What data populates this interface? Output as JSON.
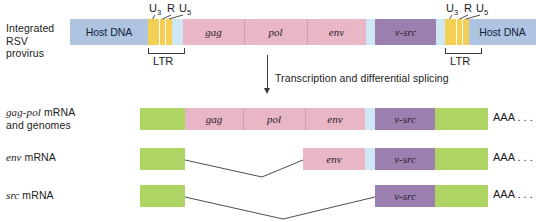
{
  "figure": {
    "background": "#ffffff"
  },
  "colors": {
    "host_dna": "#aec4e0",
    "ltr": "#f5cf55",
    "light_blue": "#cfe7f5",
    "pink": "#e8b6c4",
    "purple": "#9b7fae",
    "green": "#aed464",
    "line": "#3a3a3a"
  },
  "row_labels": {
    "provirus_line1": "Integrated",
    "provirus_line2": "RSV",
    "provirus_line3": "provirus",
    "gagpol_italic": "gag-pol",
    "gagpol_rest": " mRNA",
    "gagpol_line2": "and genomes",
    "env_italic": "env",
    "env_rest": " mRNA",
    "src_italic": "src",
    "src_rest": " mRNA"
  },
  "ltr_annotations": {
    "u3": "U",
    "u3_sub": "3",
    "r": "R",
    "u5": "U",
    "u5_sub": "5",
    "brace_label": "LTR"
  },
  "process_arrow": {
    "label": "Transcription and differential splicing"
  },
  "poly_a": {
    "label": "AAA . . ."
  },
  "provirus_segments": [
    {
      "name": "host-dna-left",
      "label": "Host DNA",
      "color": "host_dna",
      "x": 70,
      "w": 78
    },
    {
      "name": "ltr-left-u3",
      "label": "",
      "color": "ltr",
      "x": 148,
      "w": 11
    },
    {
      "name": "ltr-left-r",
      "label": "",
      "color": "ltr",
      "x": 160,
      "w": 5
    },
    {
      "name": "ltr-left-u5",
      "label": "",
      "color": "ltr",
      "x": 166,
      "w": 6
    },
    {
      "name": "leader-left",
      "label": "",
      "color": "light_blue",
      "x": 172,
      "w": 11
    },
    {
      "name": "gag",
      "label": "gag",
      "color": "pink",
      "x": 183,
      "w": 61
    },
    {
      "name": "pol",
      "label": "pol",
      "color": "pink",
      "x": 244,
      "w": 63
    },
    {
      "name": "env",
      "label": "env",
      "color": "pink",
      "x": 307,
      "w": 59
    },
    {
      "name": "spacer-right",
      "label": "",
      "color": "light_blue",
      "x": 366,
      "w": 9
    },
    {
      "name": "v-src",
      "label": "v-src",
      "color": "purple",
      "x": 375,
      "w": 61
    },
    {
      "name": "spacer-right-2",
      "label": "",
      "color": "light_blue",
      "x": 436,
      "w": 9
    },
    {
      "name": "ltr-right-u3",
      "label": "",
      "color": "ltr",
      "x": 445,
      "w": 11
    },
    {
      "name": "ltr-right-r",
      "label": "",
      "color": "ltr",
      "x": 457,
      "w": 5
    },
    {
      "name": "ltr-right-u5",
      "label": "",
      "color": "ltr",
      "x": 463,
      "w": 6
    },
    {
      "name": "host-dna-right",
      "label": "Host DNA",
      "color": "host_dna",
      "x": 469,
      "w": 67
    }
  ],
  "gagpol_segments": [
    {
      "name": "cap-5prime",
      "label": "",
      "color": "green",
      "x": 140,
      "w": 45
    },
    {
      "name": "gag",
      "label": "gag",
      "color": "pink",
      "x": 185,
      "w": 58
    },
    {
      "name": "pol",
      "label": "pol",
      "color": "pink",
      "x": 243,
      "w": 62
    },
    {
      "name": "env",
      "label": "env",
      "color": "pink",
      "x": 305,
      "w": 60
    },
    {
      "name": "spacer",
      "label": "",
      "color": "light_blue",
      "x": 365,
      "w": 10
    },
    {
      "name": "v-src",
      "label": "v-src",
      "color": "purple",
      "x": 375,
      "w": 60
    },
    {
      "name": "polya-green",
      "label": "",
      "color": "green",
      "x": 435,
      "w": 53
    },
    {
      "name": "poly-a-text",
      "label": "AAA . . .",
      "color": "none",
      "x": 493,
      "w": 43
    }
  ],
  "env_segments": [
    {
      "name": "cap-5prime",
      "label": "",
      "color": "green",
      "x": 140,
      "w": 45
    },
    {
      "name": "env",
      "label": "env",
      "color": "pink",
      "x": 303,
      "w": 62
    },
    {
      "name": "spacer",
      "label": "",
      "color": "light_blue",
      "x": 365,
      "w": 10
    },
    {
      "name": "v-src",
      "label": "v-src",
      "color": "purple",
      "x": 375,
      "w": 60
    },
    {
      "name": "polya-green",
      "label": "",
      "color": "green",
      "x": 435,
      "w": 53
    },
    {
      "name": "poly-a-text",
      "label": "AAA . . .",
      "color": "none",
      "x": 493,
      "w": 43
    }
  ],
  "src_segments": [
    {
      "name": "cap-5prime",
      "label": "",
      "color": "green",
      "x": 140,
      "w": 45
    },
    {
      "name": "v-src",
      "label": "v-src",
      "color": "purple",
      "x": 375,
      "w": 60
    },
    {
      "name": "polya-green",
      "label": "",
      "color": "green",
      "x": 435,
      "w": 53
    },
    {
      "name": "poly-a-text",
      "label": "AAA . . .",
      "color": "none",
      "x": 493,
      "w": 43
    }
  ],
  "chart_data": {
    "type": "diagram",
    "rows": [
      {
        "label": "Integrated RSV provirus",
        "parts": [
          "Host DNA",
          "U3",
          "R",
          "U5",
          "gag",
          "pol",
          "env",
          "v-src",
          "U3",
          "R",
          "U5",
          "Host DNA"
        ]
      },
      {
        "label": "gag-pol mRNA and genomes",
        "parts": [
          "5' cap region",
          "gag",
          "pol",
          "env",
          "v-src",
          "poly-A region",
          "AAA . . ."
        ]
      },
      {
        "label": "env mRNA",
        "parts": [
          "5' cap region",
          "env",
          "v-src",
          "poly-A region",
          "AAA . . ."
        ]
      },
      {
        "label": "src mRNA",
        "parts": [
          "5' cap region",
          "v-src",
          "poly-A region",
          "AAA . . ."
        ]
      }
    ],
    "annotations": [
      "U3 R U5",
      "LTR",
      "Transcription and differential splicing"
    ]
  }
}
